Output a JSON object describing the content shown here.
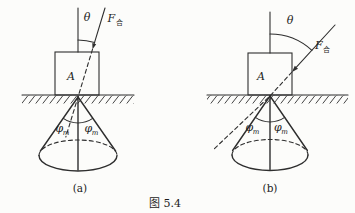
{
  "title": "图 5.4",
  "colors": {
    "background": "#fcfcfa",
    "line": "#2e2e2e",
    "text": "#1c1c1c"
  },
  "subfigures": {
    "a": {
      "label": "(a)",
      "angle": "θ",
      "force_symbol": "F",
      "force_subscript": "合",
      "block": "A",
      "phi_left": "φ",
      "phi_left_sub": "m",
      "phi_right": "φ",
      "phi_right_sub": "m"
    },
    "b": {
      "label": "(b)",
      "angle": "θ",
      "force_symbol": "F",
      "force_subscript": "合",
      "block": "A",
      "phi_left": "φ",
      "phi_left_sub": "m",
      "phi_right": "φ",
      "phi_right_sub": "m"
    }
  }
}
